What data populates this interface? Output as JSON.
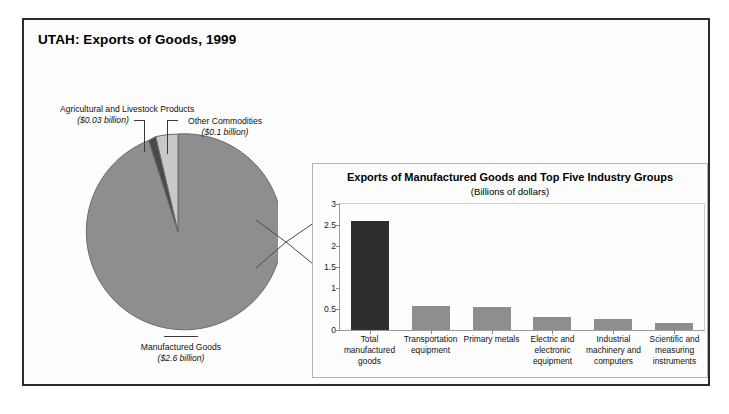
{
  "figure": {
    "title": "UTAH: Exports of Goods, 1999"
  },
  "colors": {
    "frame_border": "#2b2b2b",
    "pie_manufactured": "#8e8e8e",
    "pie_other": "#c8c8c8",
    "pie_agricultural": "#4a4a4a",
    "pie_outline": "#6a6a6a",
    "bar_total": "#2e2e2e",
    "bar_industry": "#8e8e8e",
    "axis": "#9a9a9a",
    "background": "#fdfdfd"
  },
  "pie": {
    "labels": {
      "agricultural": {
        "name": "Agricultural and Livestock Products",
        "amount": "($0.03 billion)"
      },
      "other": {
        "name": "Other Commodities",
        "amount": "($0.1 billion)"
      },
      "manufactured": {
        "name": "Manufactured Goods",
        "amount": "($2.6 billion)"
      }
    }
  },
  "inset": {
    "title": "Exports of Manufactured Goods and Top Five Industry Groups",
    "subtitle": "(Billions of dollars)"
  },
  "chart_data": [
    {
      "type": "pie",
      "title": "UTAH: Exports of Goods, 1999",
      "unit": "Billions of dollars",
      "labels": [
        "Manufactured Goods",
        "Other Commodities",
        "Agricultural and Livestock Products"
      ],
      "values": [
        2.6,
        0.1,
        0.03
      ],
      "value_labels": [
        "($2.6 billion)",
        "($0.1 billion)",
        "($0.03 billion)"
      ],
      "colors": [
        "#8e8e8e",
        "#c8c8c8",
        "#4a4a4a"
      ],
      "start_angle_deg": -90,
      "direction": "counterclockwise",
      "legend": "labels with leader lines outside slices"
    },
    {
      "type": "bar",
      "title": "Exports of Manufactured Goods and Top Five Industry Groups",
      "subtitle": "(Billions of dollars)",
      "xlabel": "",
      "ylabel": "",
      "ylim": [
        0,
        3
      ],
      "yticks": [
        0,
        0.5,
        1,
        1.5,
        2,
        2.5,
        3
      ],
      "ytick_labels": [
        "0",
        "0.5",
        "1",
        "1.5",
        "2",
        "2.5",
        "3"
      ],
      "grid": false,
      "legend": "none",
      "categories": [
        "Total manufactured goods",
        "Transportation equipment",
        "Primary metals",
        "Electric and electronic equipment",
        "Industrial machinery and computers",
        "Scientific and measuring instruments"
      ],
      "values": [
        2.6,
        0.56,
        0.55,
        0.3,
        0.27,
        0.17
      ],
      "bar_colors": [
        "#2e2e2e",
        "#8e8e8e",
        "#8e8e8e",
        "#8e8e8e",
        "#8e8e8e",
        "#8e8e8e"
      ]
    }
  ]
}
